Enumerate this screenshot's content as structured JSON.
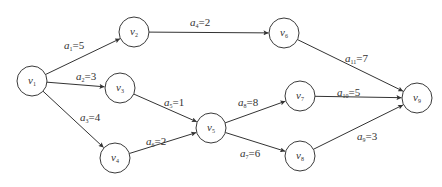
{
  "diagram": {
    "type": "AOE activity network (directed acyclic graph)",
    "nodes": [
      {
        "id": "v1",
        "name": "v",
        "sub": "1",
        "x": 32,
        "y": 81
      },
      {
        "id": "v2",
        "name": "v",
        "sub": "2",
        "x": 134,
        "y": 32
      },
      {
        "id": "v3",
        "name": "v",
        "sub": "3",
        "x": 120,
        "y": 88
      },
      {
        "id": "v4",
        "name": "v",
        "sub": "4",
        "x": 115,
        "y": 158
      },
      {
        "id": "v5",
        "name": "v",
        "sub": "5",
        "x": 211,
        "y": 128
      },
      {
        "id": "v6",
        "name": "v",
        "sub": "6",
        "x": 284,
        "y": 33
      },
      {
        "id": "v7",
        "name": "v",
        "sub": "7",
        "x": 300,
        "y": 96
      },
      {
        "id": "v8",
        "name": "v",
        "sub": "8",
        "x": 300,
        "y": 156
      },
      {
        "id": "v9",
        "name": "v",
        "sub": "9",
        "x": 417,
        "y": 98
      }
    ],
    "node_radius": 15,
    "edges": [
      {
        "id": "a1",
        "from": "v1",
        "to": "v2",
        "var": "a",
        "sub": "1",
        "weight": "5",
        "label": "=5",
        "lx": 64,
        "ly": 49
      },
      {
        "id": "a2",
        "from": "v1",
        "to": "v3",
        "var": "a",
        "sub": "2",
        "weight": "3",
        "label": "=3",
        "lx": 76,
        "ly": 80
      },
      {
        "id": "a3",
        "from": "v1",
        "to": "v4",
        "var": "a",
        "sub": "3",
        "weight": "4",
        "label": "=4",
        "lx": 80,
        "ly": 121
      },
      {
        "id": "a4",
        "from": "v2",
        "to": "v6",
        "var": "a",
        "sub": "4",
        "weight": "2",
        "label": "=2",
        "lx": 190,
        "ly": 26
      },
      {
        "id": "a5",
        "from": "v3",
        "to": "v5",
        "var": "a",
        "sub": "5",
        "weight": "1",
        "label": "=1",
        "lx": 164,
        "ly": 106
      },
      {
        "id": "a6",
        "from": "v4",
        "to": "v5",
        "var": "a",
        "sub": "6",
        "weight": "2",
        "label": "=2",
        "lx": 146,
        "ly": 145
      },
      {
        "id": "a7",
        "from": "v5",
        "to": "v8",
        "var": "a",
        "sub": "7",
        "weight": "6",
        "label": "=6",
        "lx": 240,
        "ly": 157
      },
      {
        "id": "a8",
        "from": "v5",
        "to": "v7",
        "var": "a",
        "sub": "8",
        "weight": "8",
        "label": "=8",
        "lx": 238,
        "ly": 106
      },
      {
        "id": "a9",
        "from": "v8",
        "to": "v9",
        "var": "a",
        "sub": "9",
        "weight": "3",
        "label": "=3",
        "lx": 357,
        "ly": 140
      },
      {
        "id": "a10",
        "from": "v7",
        "to": "v9",
        "var": "a",
        "sub": "10",
        "weight": "5",
        "label": "=5",
        "lx": 337,
        "ly": 96
      },
      {
        "id": "a11",
        "from": "v6",
        "to": "v9",
        "var": "a",
        "sub": "11",
        "weight": "7",
        "label": "=7",
        "lx": 345,
        "ly": 62
      }
    ]
  },
  "colors": {
    "stroke": "#333333",
    "background": "#ffffff"
  }
}
